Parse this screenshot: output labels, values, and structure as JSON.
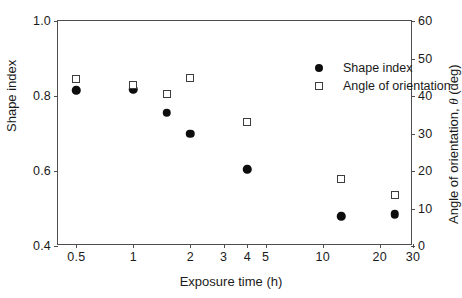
{
  "chart_data": {
    "type": "scatter",
    "title": "",
    "xlabel": "Exposure time (h)",
    "ylabel": "Shape index",
    "ylabel_right": "Angle of orientation, θ (deg)",
    "xscale": "log",
    "xlim": [
      0.4,
      30
    ],
    "ylim": [
      0.4,
      1.0
    ],
    "ylim_right": [
      0,
      60
    ],
    "grid": false,
    "legend_position": "upper right inside",
    "xticks": [
      {
        "value": 0.5,
        "label": "0.5"
      },
      {
        "value": 1,
        "label": "1"
      },
      {
        "value": 2,
        "label": "2"
      },
      {
        "value": 3,
        "label": "3"
      },
      {
        "value": 4,
        "label": "4"
      },
      {
        "value": 5,
        "label": "5"
      },
      {
        "value": 10,
        "label": "10"
      },
      {
        "value": 20,
        "label": "20"
      },
      {
        "value": 30,
        "label": "30"
      }
    ],
    "yticks_left": [
      {
        "value": 0.4,
        "label": "0.4"
      },
      {
        "value": 0.6,
        "label": "0.6"
      },
      {
        "value": 0.8,
        "label": "0.8"
      },
      {
        "value": 1.0,
        "label": "1.0"
      }
    ],
    "yticks_right": [
      {
        "value": 0,
        "label": "0"
      },
      {
        "value": 10,
        "label": "10"
      },
      {
        "value": 20,
        "label": "20"
      },
      {
        "value": 30,
        "label": "30"
      },
      {
        "value": 40,
        "label": "40"
      },
      {
        "value": 50,
        "label": "50"
      },
      {
        "value": 60,
        "label": "60"
      }
    ],
    "series": [
      {
        "name": "Shape index",
        "marker": "filled-circle",
        "axis": "left",
        "color": "#0d0d0d",
        "x": [
          0.5,
          1.0,
          1.5,
          2.0,
          4.0,
          12.5,
          24.0
        ],
        "y": [
          0.815,
          0.818,
          0.755,
          0.7,
          0.605,
          0.48,
          0.485
        ]
      },
      {
        "name": "Angle of orientation",
        "marker": "open-square",
        "axis": "right",
        "color": "#3d3d3d",
        "x": [
          0.5,
          1.0,
          1.5,
          2.0,
          4.0,
          12.5,
          24.0
        ],
        "y": [
          44.5,
          43.0,
          40.5,
          44.8,
          33.0,
          18.0,
          13.5
        ]
      }
    ]
  },
  "legend": {
    "items": [
      {
        "label": "Shape index",
        "marker": "filled-circle"
      },
      {
        "label": "Angle of orientation",
        "marker": "open-square"
      }
    ]
  }
}
